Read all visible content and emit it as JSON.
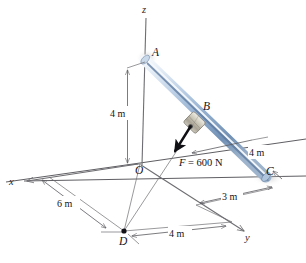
{
  "figure": {
    "type": "statics-free-body-diagram",
    "axes": [
      {
        "name": "z",
        "label": "z",
        "direction": "vertical-up"
      },
      {
        "name": "x",
        "label": "x",
        "direction": "lower-left"
      },
      {
        "name": "y",
        "label": "y",
        "direction": "lower-right"
      }
    ],
    "points": [
      {
        "name": "A",
        "label": "A",
        "note": "top end of rod on z axis"
      },
      {
        "name": "B",
        "label": "B",
        "note": "collar on rod, force application point"
      },
      {
        "name": "C",
        "label": "C",
        "note": "lower end of rod in x-y plane"
      },
      {
        "name": "O",
        "label": "O",
        "note": "origin"
      },
      {
        "name": "D",
        "label": "D",
        "note": "point in x-y plane, force line target"
      }
    ],
    "dimensions": [
      {
        "name": "height-OA",
        "label": "4 m",
        "value": 4,
        "unit": "m",
        "from": "O",
        "to": "A"
      },
      {
        "name": "offset-C-x",
        "label": "4 m",
        "value": 4,
        "unit": "m",
        "note": "along x from plane edge to C"
      },
      {
        "name": "offset-C-y",
        "label": "3 m",
        "value": 3,
        "unit": "m",
        "note": "along y to C"
      },
      {
        "name": "offset-D-x",
        "label": "6 m",
        "value": 6,
        "unit": "m",
        "note": "from x axis to D"
      },
      {
        "name": "offset-D-y",
        "label": "4 m",
        "value": 4,
        "unit": "m",
        "note": "from D along y"
      }
    ],
    "force": {
      "label": "F = 600 N",
      "symbol": "F",
      "equals": " = ",
      "magnitude": "600",
      "unit": "N",
      "applied_at": "B",
      "directed_toward": "D"
    },
    "colors": {
      "rod_light": "#e8eef7",
      "rod_mid": "#9cb6d4",
      "rod_dark": "#5f7fa6",
      "collar": "#b9b4a6",
      "line": "#5a5a5f",
      "force": "#111115",
      "background": "#ffffff"
    }
  }
}
